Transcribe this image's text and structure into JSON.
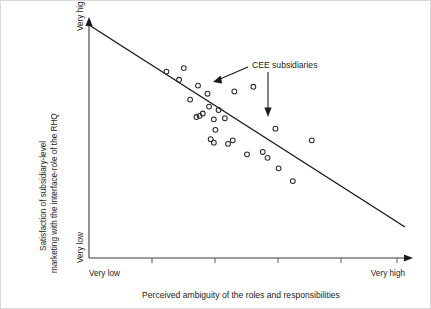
{
  "chart_data": {
    "type": "scatter",
    "title": "",
    "xlabel": "Perceived ambiguity of the roles and responsibilities",
    "ylabel": "Satisfaction of subsidiary-level marketing with the interface-role of the RHQ",
    "ylabel_line1": "Satisfaction of subsidiary-level",
    "ylabel_line2": "marketing with the interface-role of the RHQ",
    "x_tick_labels": [
      "Very low",
      "Very high"
    ],
    "y_tick_labels": [
      "Very high",
      "Very low"
    ],
    "x_axis_low_label": "Very low",
    "x_axis_high_label": "Very high",
    "y_axis_low_label": "Very low",
    "y_axis_high_label": "Very high",
    "xlim": [
      0,
      100
    ],
    "ylim": [
      0,
      100
    ],
    "grid": false,
    "legend": false,
    "annotations": [
      {
        "text": "CEE subsidiaries",
        "targets": [
          "point-upper",
          "point-lower"
        ]
      }
    ],
    "trend_line": {
      "x0": 0,
      "y0": 100,
      "x1": 100,
      "y1": 20,
      "style": "solid"
    },
    "points": [
      {
        "x": 24.5,
        "y": 80.0
      },
      {
        "x": 30.0,
        "y": 81.5
      },
      {
        "x": 28.5,
        "y": 76.5
      },
      {
        "x": 34.5,
        "y": 74.0
      },
      {
        "x": 32.0,
        "y": 68.0
      },
      {
        "x": 37.5,
        "y": 70.5
      },
      {
        "x": 38.0,
        "y": 65.0
      },
      {
        "x": 36.0,
        "y": 62.0
      },
      {
        "x": 35.0,
        "y": 61.0
      },
      {
        "x": 34.0,
        "y": 60.5
      },
      {
        "x": 39.5,
        "y": 59.5
      },
      {
        "x": 41.0,
        "y": 63.5
      },
      {
        "x": 43.0,
        "y": 60.0
      },
      {
        "x": 40.0,
        "y": 55.0
      },
      {
        "x": 38.5,
        "y": 51.0
      },
      {
        "x": 39.5,
        "y": 49.5
      },
      {
        "x": 44.0,
        "y": 49.0
      },
      {
        "x": 45.5,
        "y": 50.5
      },
      {
        "x": 50.0,
        "y": 44.5
      },
      {
        "x": 55.0,
        "y": 45.5
      },
      {
        "x": 56.5,
        "y": 43.0
      },
      {
        "x": 60.0,
        "y": 38.5
      },
      {
        "x": 64.5,
        "y": 33.0
      },
      {
        "x": 59.0,
        "y": 55.5
      },
      {
        "x": 70.5,
        "y": 50.5
      },
      {
        "x": 46.0,
        "y": 71.5
      },
      {
        "x": 52.0,
        "y": 73.5
      }
    ],
    "highlighted_points": [
      {
        "x": 52.0,
        "y": 73.5,
        "label": "CEE subsidiaries"
      },
      {
        "x": 59.0,
        "y": 55.5,
        "label": "CEE subsidiaries"
      }
    ],
    "n_points": 27
  }
}
